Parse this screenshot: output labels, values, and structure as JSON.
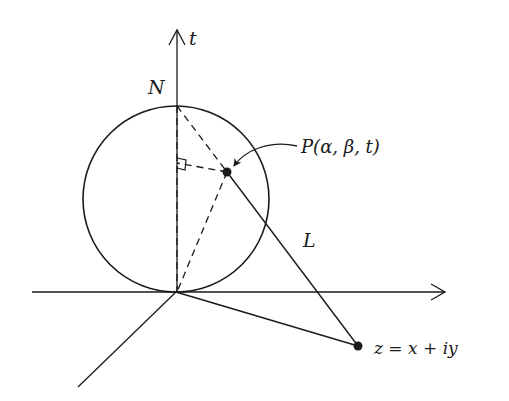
{
  "diagram": {
    "type": "stereographic-projection",
    "colors": {
      "ink": "#1a1a1a",
      "background": "#ffffff"
    },
    "labels": {
      "t_axis": "t",
      "north_pole": "N",
      "point_p": "P(α, β, t)",
      "line": "L",
      "point_z": "z = x + iy"
    },
    "elements": [
      {
        "id": "t-axis",
        "kind": "axis",
        "description": "vertical t-axis with arrowhead"
      },
      {
        "id": "x-axis",
        "kind": "axis",
        "description": "horizontal axis with arrowhead"
      },
      {
        "id": "y-axis",
        "kind": "axis",
        "description": "oblique axis toward viewer"
      },
      {
        "id": "sphere",
        "kind": "circle",
        "description": "Riemann sphere tangent to plane at origin"
      },
      {
        "id": "line-L",
        "kind": "solid-line",
        "description": "line from N through P to z"
      },
      {
        "id": "origin-to-z",
        "kind": "solid-line",
        "description": "segment from origin to z"
      },
      {
        "id": "dashed-NO",
        "kind": "dashed-line",
        "description": "vertical diameter N to origin"
      },
      {
        "id": "dashed-NP",
        "kind": "dashed-line",
        "description": "chord N to P"
      },
      {
        "id": "dashed-PO",
        "kind": "dashed-line",
        "description": "chord P to origin"
      },
      {
        "id": "dashed-foot",
        "kind": "dashed-line",
        "description": "perpendicular from P to vertical diameter"
      },
      {
        "id": "right-angle",
        "kind": "marker",
        "description": "right angle marker at foot of perpendicular"
      },
      {
        "id": "pointer",
        "kind": "curved-arrow",
        "description": "arrow from P label to point P"
      }
    ]
  }
}
